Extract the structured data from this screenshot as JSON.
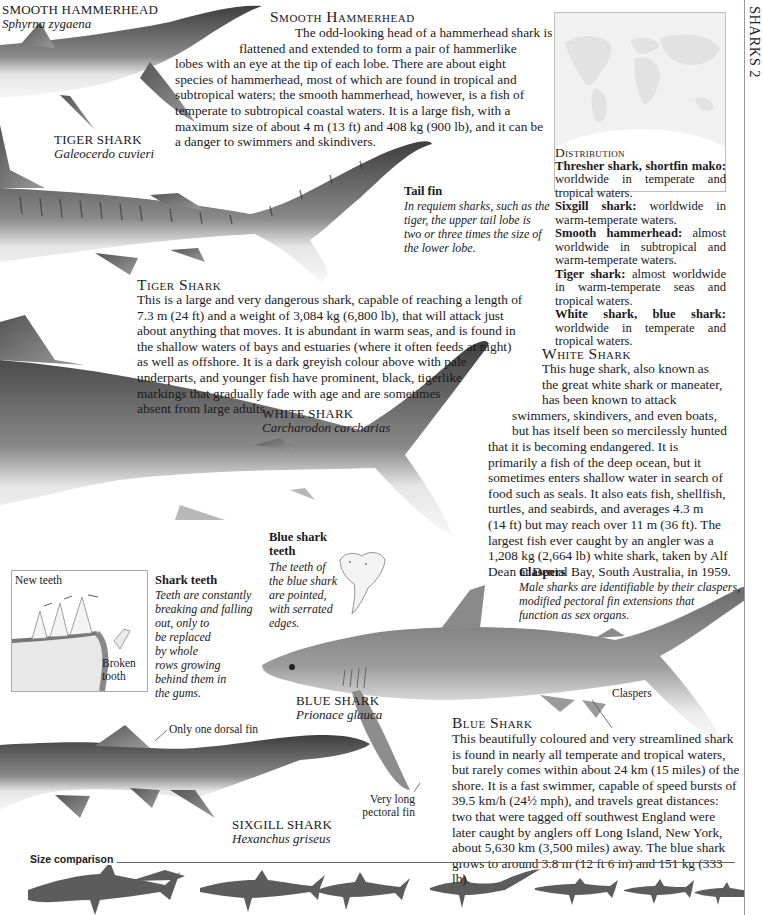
{
  "page": {
    "side_title": "SHARKS 2"
  },
  "smooth_hammerhead": {
    "label": "SMOOTH HAMMERHEAD",
    "latin": "Sphyrna zygaena",
    "heading": "Smooth Hammerhead",
    "lines": [
      "The odd-looking head of a hammerhead shark is",
      "flattened and extended to form a pair of hammerlike",
      "lobes with an eye at the tip of each lobe. There are about eight",
      "species of hammerhead, most of which are found in tropical and",
      "subtropical waters; the smooth hammerhead, however, is a fish of",
      "temperate to subtropical coastal waters. It is a large fish, with a",
      "maximum size of about 4 m (13 ft) and 408 kg (900 lb), and it can be",
      "a danger to swimmers and skindivers."
    ]
  },
  "tiger_shark": {
    "label": "TIGER SHARK",
    "latin": "Galeocerdo cuvieri",
    "heading": "Tiger Shark",
    "lines": [
      "This is a large and very dangerous shark, capable of reaching a length of",
      "7.3 m (24 ft) and a weight of 3,084 kg (6,800 lb), that will attack just",
      "about anything that moves. It is abundant in warm seas, and is found in",
      "the shallow waters of bays and estuaries (where it often feeds at night)",
      "as well as offshore. It is a dark greyish colour above with pale",
      "underparts, and younger fish have prominent, black, tigerlike",
      "markings that gradually fade with age and are sometimes",
      "absent from large adults."
    ]
  },
  "tail_fin": {
    "title": "Tail fin",
    "lines": [
      "In requiem sharks, such as the",
      "tiger, the upper tail lobe is",
      "two or three times the size of",
      "the lower lobe."
    ]
  },
  "distribution": {
    "heading": "Distribution",
    "entries": [
      {
        "name": "Thresher shark, shortfin mako:",
        "text": " worldwide in temperate and tropical waters."
      },
      {
        "name": "Sixgill shark:",
        "text": " worldwide in warm-temperate waters."
      },
      {
        "name": "Smooth hammerhead:",
        "text": " almost worldwide in subtropical and warm-temperate waters."
      },
      {
        "name": "Tiger shark:",
        "text": " almost worldwide in warm-temperate seas and tropical waters."
      },
      {
        "name": "White shark, blue shark:",
        "text": " worldwide in temperate and tropical waters."
      }
    ]
  },
  "white_shark": {
    "label": "WHITE SHARK",
    "latin": "Carcharodon carcharias",
    "heading": "White Shark",
    "lines": [
      "This huge shark, also known as",
      "the great white shark or maneater,",
      "has been known to attack",
      "swimmers, skindivers, and even boats,",
      "but has itself been so mercilessly hunted",
      "that it is becoming endangered. It is",
      "primarily a fish of the deep ocean, but it",
      "sometimes enters shallow water in search of",
      "food such as seals. It also eats fish, shellfish,",
      "turtles, and seabirds, and averages 4.3 m",
      "(14 ft) but may reach over 11 m (36 ft). The",
      "largest fish ever caught by an angler was a",
      "1,208 kg (2,664 lb) white shark, taken by Alf",
      "Dean at Denial Bay, South Australia, in 1959."
    ]
  },
  "shark_teeth": {
    "callout_new": "New teeth",
    "callout_broken": [
      "Broken",
      "tooth"
    ],
    "title": "Shark teeth",
    "lines": [
      "Teeth are constantly",
      "breaking and falling",
      "out, only to",
      "be replaced",
      "by whole",
      "rows growing",
      "behind them in",
      "the gums."
    ]
  },
  "blue_shark_teeth": {
    "title_lines": [
      "Blue shark",
      "teeth"
    ],
    "lines": [
      "The teeth of",
      "the blue shark",
      "are pointed,",
      "with serrated",
      "edges."
    ]
  },
  "claspers": {
    "title": "Claspers",
    "lines": [
      "Male sharks are identifiable by their claspers,",
      "modified pectoral fin extensions that",
      "function as sex organs."
    ],
    "callout": "Claspers"
  },
  "blue_shark": {
    "label": "BLUE SHARK",
    "latin": "Prionace glauca",
    "heading": "Blue Shark",
    "lines": [
      "This beautifully coloured and very streamlined shark",
      "is found in nearly all temperate and tropical waters,",
      "but rarely comes within about 24 km (15 miles) of the",
      "shore. It is a fast swimmer, capable of speed bursts of",
      "39.5 km/h (24½ mph), and travels great distances:",
      "two that were tagged off southwest England were",
      "later caught by anglers off Long Island, New York,",
      "about 5,630 km (3,500 miles) away. The blue shark",
      "grows to around 3.8 m (12 ft 6 in) and 151 kg (333 lb)."
    ],
    "callout_fin": [
      "Very long",
      "pectoral fin"
    ]
  },
  "sixgill_shark": {
    "label": "SIXGILL SHARK",
    "latin": "Hexanchus griseus",
    "callout": "Only one dorsal fin"
  },
  "size_comparison": {
    "label": "Size comparison",
    "silhouettes": [
      "white-shark",
      "tiger-shark",
      "smooth-hammerhead",
      "thresher-shark",
      "sixgill-shark",
      "shortfin-mako",
      "blue-shark"
    ]
  },
  "colors": {
    "shark_dark": "#4a4a4a",
    "shark_mid": "#7d7d7d",
    "shark_light": "#cfcfcf",
    "silhouette": "#5c5c5c",
    "rule": "#9a9a9a"
  }
}
